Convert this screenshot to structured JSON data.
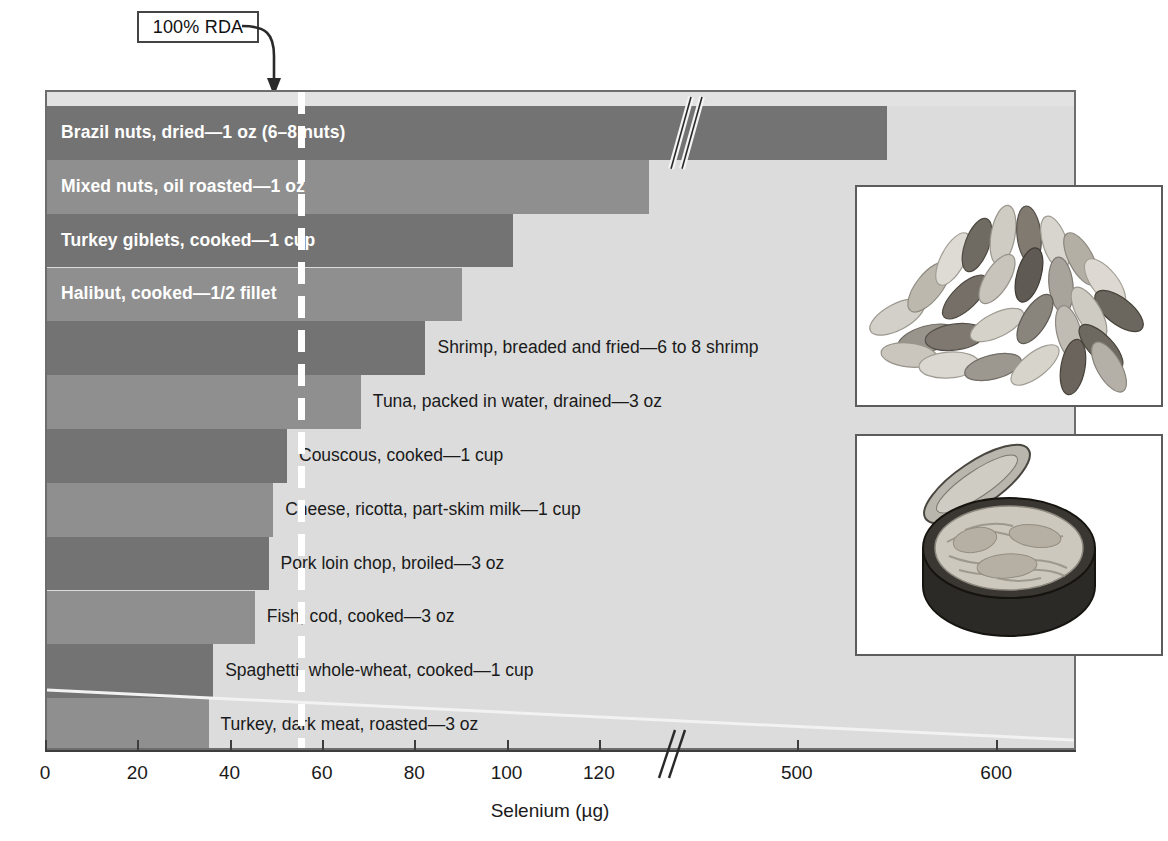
{
  "figure": {
    "callout_label": "100% RDA",
    "y_axis_title": "Food and serving size",
    "x_axis_title": "Selenium (µg)"
  },
  "photos": [
    {
      "name": "brazil-nuts-photo",
      "caption": "pile of shelled Brazil nuts"
    },
    {
      "name": "canned-tuna-photo",
      "caption": "open can of tuna packed in water"
    }
  ],
  "chart_data": {
    "type": "bar",
    "orientation": "horizontal",
    "title": "",
    "xlabel": "Selenium (µg)",
    "ylabel": "Food and serving size",
    "xlim": [
      0,
      640
    ],
    "grid": false,
    "legend": "none",
    "axis_break": {
      "from": 130,
      "to": 450,
      "label": "//"
    },
    "reference_line": {
      "label": "100% RDA",
      "value": 55
    },
    "tick_labels": [
      "0",
      "20",
      "40",
      "60",
      "80",
      "100",
      "120",
      "500",
      "600"
    ],
    "tick_values": [
      0,
      20,
      40,
      60,
      80,
      100,
      120,
      500,
      600
    ],
    "categories": [
      "Brazil nuts, dried—1 oz (6–8 nuts)",
      "Mixed nuts, oil roasted—1 oz",
      "Turkey giblets, cooked—1 cup",
      "Halibut, cooked—1/2 fillet",
      "Shrimp, breaded and fried—6 to 8 shrimp",
      "Tuna, packed in water, drained—3 oz",
      "Couscous, cooked—1 cup",
      "Cheese, ricotta, part-skim milk—1 cup",
      "Pork loin chop, broiled—3 oz",
      "Fish, cod, cooked—3 oz",
      "Spaghetti, whole-wheat, cooked—1 cup",
      "Turkey, dark meat, roasted—3 oz"
    ],
    "values": [
      544,
      143,
      101,
      90,
      82,
      68,
      52,
      49,
      48,
      45,
      36,
      35
    ],
    "bars": [
      {
        "label": "Brazil nuts, dried—1 oz (6–8 nuts)",
        "value": 544,
        "label_position": "inside",
        "tone": "dark",
        "broken": true
      },
      {
        "label": "Mixed nuts, oil roasted—1 oz",
        "value": 143,
        "label_position": "inside",
        "tone": "light",
        "broken": false
      },
      {
        "label": "Turkey giblets, cooked—1 cup",
        "value": 101,
        "label_position": "inside",
        "tone": "dark",
        "broken": false
      },
      {
        "label": "Halibut, cooked—1/2 fillet",
        "value": 90,
        "label_position": "inside",
        "tone": "light",
        "broken": false
      },
      {
        "label": "Shrimp, breaded and fried—6 to 8 shrimp",
        "value": 82,
        "label_position": "outside",
        "tone": "dark",
        "broken": false
      },
      {
        "label": "Tuna, packed in water, drained—3 oz",
        "value": 68,
        "label_position": "outside",
        "tone": "light",
        "broken": false
      },
      {
        "label": "Couscous, cooked—1 cup",
        "value": 52,
        "label_position": "outside",
        "tone": "dark",
        "broken": false
      },
      {
        "label": "Cheese, ricotta, part-skim milk—1 cup",
        "value": 49,
        "label_position": "outside",
        "tone": "light",
        "broken": false
      },
      {
        "label": "Pork loin chop, broiled—3 oz",
        "value": 48,
        "label_position": "outside",
        "tone": "dark",
        "broken": false
      },
      {
        "label": "Fish, cod, cooked—3 oz",
        "value": 45,
        "label_position": "outside",
        "tone": "light",
        "broken": false
      },
      {
        "label": "Spaghetti, whole-wheat, cooked—1 cup",
        "value": 36,
        "label_position": "outside",
        "tone": "dark",
        "broken": false
      },
      {
        "label": "Turkey, dark meat, roasted—3 oz",
        "value": 35,
        "label_position": "outside",
        "tone": "light",
        "broken": false
      }
    ],
    "colors": {
      "bar_dark": "#737373",
      "bar_light": "#8f8f8f",
      "plot_background": "#dcdcdc",
      "reference_line": "#ffffff",
      "axis": "#3d3d3d"
    }
  }
}
